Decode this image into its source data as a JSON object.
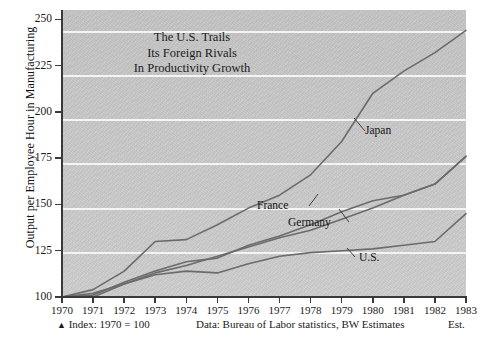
{
  "chart_data": {
    "type": "line",
    "title": "The U.S. Trails Its Foreign Rivals In Productivity Growth",
    "title_lines": [
      "The U.S. Trails",
      "Its Foreign Rivals",
      "In Productivity Growth"
    ],
    "xlabel": "",
    "ylabel": "Output per Employee Hour in Manufacturing",
    "x": [
      1970,
      1971,
      1972,
      1973,
      1974,
      1975,
      1976,
      1977,
      1978,
      1979,
      1980,
      1981,
      1982,
      1983
    ],
    "xticklabels": [
      "1970",
      "1971",
      "1972",
      "1973",
      "1974",
      "1975",
      "1976",
      "1977",
      "1978",
      "1979",
      "1980",
      "1981",
      "1982",
      "1983"
    ],
    "yticklabels": [
      "100",
      "125",
      "150",
      "175",
      "200",
      "225",
      "250"
    ],
    "ylim": [
      100,
      255
    ],
    "yticks": [
      100,
      125,
      150,
      175,
      200,
      225,
      250
    ],
    "grid": true,
    "legend_position": "inline-annotations",
    "series": [
      {
        "name": "Japan",
        "values": [
          100,
          104,
          114,
          130,
          131,
          139,
          148,
          155,
          166,
          184,
          210,
          222,
          232,
          244
        ]
      },
      {
        "name": "France",
        "values": [
          100,
          101,
          108,
          114,
          119,
          121,
          128,
          133,
          139,
          146,
          152,
          155,
          161,
          176
        ]
      },
      {
        "name": "Germany",
        "values": [
          100,
          100,
          107,
          113,
          117,
          122,
          127,
          132,
          136,
          142,
          148,
          155,
          161,
          176
        ]
      },
      {
        "name": "U.S.",
        "values": [
          100,
          102,
          107,
          112,
          114,
          113,
          118,
          122,
          124,
          125,
          126,
          128,
          130,
          145
        ]
      }
    ],
    "annotations": [
      {
        "label": "Japan",
        "note": "inline series label"
      },
      {
        "label": "France",
        "note": "inline series label"
      },
      {
        "label": "Germany",
        "note": "inline series label"
      },
      {
        "label": "U.S.",
        "note": "inline series label"
      }
    ]
  },
  "footer": {
    "index_note": "Index:  1970 = 100",
    "index_marker": "▲",
    "data_note": "Data:  Bureau of Labor statistics, BW Estimates",
    "est_note": "Est."
  },
  "colors": {
    "plot_background": "#c9c9c9",
    "gridline": "#f4f4f4",
    "series_line": "#6b6b6b",
    "axis": "#3a3a3a",
    "text": "#1a1a1a"
  }
}
